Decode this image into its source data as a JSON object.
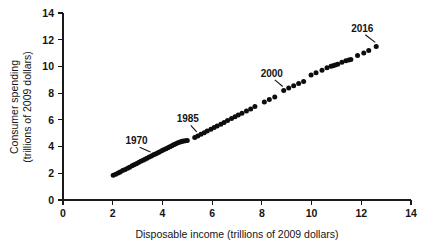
{
  "chart_data": {
    "type": "scatter",
    "title": "",
    "xlabel": "Disposable income (trillions of 2009 dollars)",
    "ylabel": "Consumer spending (trillions of 2009 dollars)",
    "ylabel_line1": "Consumer spending",
    "ylabel_line2": "(trillions of 2009 dollars)",
    "xlim": [
      0,
      14
    ],
    "ylim": [
      0,
      14
    ],
    "xticks": [
      0,
      2,
      4,
      6,
      8,
      10,
      12,
      14
    ],
    "yticks": [
      0,
      2,
      4,
      6,
      8,
      10,
      12,
      14
    ],
    "xtick_labels": [
      "0",
      "2",
      "4",
      "6",
      "8",
      "10",
      "12",
      "14"
    ],
    "ytick_labels": [
      "0",
      "2",
      "4",
      "6",
      "8",
      "10",
      "12",
      "14"
    ],
    "grid": false,
    "legend": "none",
    "marker": "filled-circle",
    "marker_color": "#0d0d0d",
    "marker_size_px": 5,
    "x": [
      2.02,
      2.12,
      2.22,
      2.3,
      2.4,
      2.5,
      2.6,
      2.68,
      2.78,
      2.86,
      2.95,
      3.04,
      3.13,
      3.22,
      3.3,
      3.38,
      3.47,
      3.56,
      3.64,
      3.72,
      3.8,
      3.88,
      3.97,
      4.05,
      4.14,
      4.22,
      4.3,
      4.38,
      4.45,
      4.52,
      4.6,
      4.68,
      4.74,
      4.8,
      4.86,
      4.93,
      5.0,
      5.3,
      5.42,
      5.55,
      5.68,
      5.8,
      5.95,
      6.08,
      6.2,
      6.35,
      6.48,
      6.62,
      6.78,
      6.92,
      7.05,
      7.2,
      7.38,
      7.55,
      7.72,
      8.1,
      8.3,
      8.52,
      8.88,
      9.08,
      9.28,
      9.48,
      9.68,
      9.98,
      10.18,
      10.42,
      10.62,
      10.78,
      10.86,
      10.95,
      11.05,
      11.22,
      11.38,
      11.5,
      11.58,
      11.85,
      12.1,
      12.3,
      12.6
    ],
    "y": [
      1.85,
      1.93,
      2.02,
      2.1,
      2.2,
      2.29,
      2.38,
      2.46,
      2.56,
      2.64,
      2.72,
      2.8,
      2.9,
      2.98,
      3.05,
      3.13,
      3.21,
      3.3,
      3.38,
      3.45,
      3.52,
      3.6,
      3.68,
      3.76,
      3.84,
      3.92,
      3.99,
      4.06,
      4.13,
      4.2,
      4.26,
      4.32,
      4.36,
      4.39,
      4.41,
      4.43,
      4.45,
      4.68,
      4.8,
      4.92,
      5.04,
      5.16,
      5.3,
      5.42,
      5.54,
      5.68,
      5.8,
      5.95,
      6.1,
      6.24,
      6.36,
      6.5,
      6.66,
      6.82,
      7.0,
      7.34,
      7.52,
      7.72,
      8.2,
      8.38,
      8.55,
      8.72,
      8.88,
      9.35,
      9.52,
      9.72,
      9.9,
      10.02,
      10.06,
      10.1,
      10.16,
      10.32,
      10.42,
      10.48,
      10.52,
      10.82,
      11.0,
      11.2,
      11.5
    ],
    "annotations": [
      {
        "label": "1970",
        "point_x": 3.56,
        "point_y": 3.3,
        "text_x": 2.96,
        "text_y": 4.18
      },
      {
        "label": "1985",
        "point_x": 5.42,
        "point_y": 4.8,
        "text_x": 5.02,
        "text_y": 5.82
      },
      {
        "label": "2000",
        "point_x": 8.88,
        "point_y": 8.2,
        "text_x": 8.4,
        "text_y": 9.22
      },
      {
        "label": "2016",
        "point_x": 12.6,
        "point_y": 11.5,
        "text_x": 12.04,
        "text_y": 12.6
      }
    ]
  }
}
